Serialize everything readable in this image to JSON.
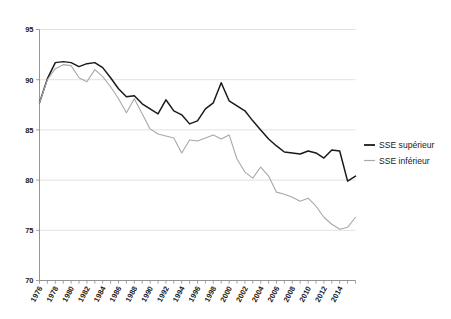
{
  "top_remnant": {
    "text": "·· ·  ··"
  },
  "legend": {
    "position": "right",
    "entries": [
      {
        "label": "SSE supérieur",
        "color": "#1a1a1a"
      },
      {
        "label": "SSE inférieur",
        "color": "#a8a8a8"
      }
    ]
  },
  "axes": {
    "y_ticks": [
      70,
      75,
      80,
      85,
      90,
      95
    ],
    "y_tick_labels": [
      "70",
      "75",
      "80",
      "85",
      "90",
      "95"
    ],
    "x_tick_labels": [
      "1976",
      "1978",
      "1980",
      "1982",
      "1984",
      "1986",
      "1988",
      "1990",
      "1992",
      "1994",
      "1996",
      "1998",
      "2000",
      "2002",
      "2004",
      "2006",
      "2008",
      "2010",
      "2012",
      "2014"
    ],
    "grid": "horizontal"
  },
  "chart_data": {
    "type": "line",
    "title": "",
    "subtitle": "",
    "xlabel": "",
    "ylabel": "",
    "xlim": [
      1976,
      2016
    ],
    "ylim": [
      70,
      95
    ],
    "grid": true,
    "legend_position": "right",
    "x": [
      1976,
      1977,
      1978,
      1979,
      1980,
      1981,
      1982,
      1983,
      1984,
      1985,
      1986,
      1987,
      1988,
      1989,
      1990,
      1991,
      1992,
      1993,
      1994,
      1995,
      1996,
      1997,
      1998,
      1999,
      2000,
      2001,
      2002,
      2003,
      2004,
      2005,
      2006,
      2007,
      2008,
      2009,
      2010,
      2011,
      2012,
      2013,
      2014,
      2015,
      2016
    ],
    "x_tick_labels": [
      "1976",
      "1978",
      "1980",
      "1982",
      "1984",
      "1986",
      "1988",
      "1990",
      "1992",
      "1994",
      "1996",
      "1998",
      "2000",
      "2002",
      "2004",
      "2006",
      "2008",
      "2010",
      "2012",
      "2014"
    ],
    "series": [
      {
        "name": "SSE supérieur",
        "color": "#1a1a1a",
        "values": [
          87.7,
          90.1,
          91.7,
          91.8,
          91.7,
          91.3,
          91.6,
          91.7,
          91.2,
          90.2,
          89.1,
          88.3,
          88.4,
          87.6,
          87.1,
          86.6,
          88.0,
          86.9,
          86.5,
          85.6,
          85.9,
          87.1,
          87.7,
          89.7,
          87.9,
          87.4,
          86.9,
          85.9,
          85.0,
          84.1,
          83.4,
          82.8,
          82.7,
          82.6,
          82.9,
          82.7,
          82.2,
          83.0,
          82.9,
          79.9,
          80.4
        ]
      },
      {
        "name": "SSE inférieur",
        "color": "#a8a8a8",
        "values": [
          87.7,
          90.0,
          91.1,
          91.5,
          91.4,
          90.2,
          89.8,
          91.0,
          90.3,
          89.3,
          88.1,
          86.7,
          88.1,
          86.6,
          85.1,
          84.6,
          84.4,
          84.2,
          82.7,
          84.0,
          83.9,
          84.2,
          84.5,
          84.1,
          84.5,
          82.1,
          80.8,
          80.2,
          81.3,
          80.4,
          78.8,
          78.6,
          78.3,
          77.9,
          78.2,
          77.4,
          76.3,
          75.6,
          75.1,
          75.3,
          76.3
        ]
      }
    ]
  }
}
